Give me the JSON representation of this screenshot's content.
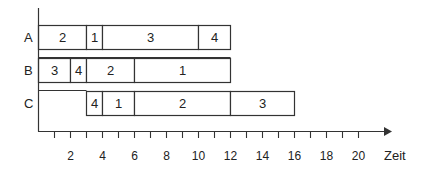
{
  "diagram": {
    "type": "gantt",
    "axis_label": "Zeit",
    "rows": [
      {
        "label": "A",
        "tasks": [
          {
            "label": "2",
            "start": 0,
            "end": 3
          },
          {
            "label": "1",
            "start": 3,
            "end": 4
          },
          {
            "label": "3",
            "start": 4,
            "end": 10
          },
          {
            "label": "4",
            "start": 10,
            "end": 12
          }
        ]
      },
      {
        "label": "B",
        "tasks": [
          {
            "label": "3",
            "start": 0,
            "end": 2
          },
          {
            "label": "4",
            "start": 2,
            "end": 3
          },
          {
            "label": "2",
            "start": 3,
            "end": 6
          },
          {
            "label": "1",
            "start": 6,
            "end": 12
          }
        ]
      },
      {
        "label": "C",
        "tasks": [
          {
            "label": "4",
            "start": 3,
            "end": 4
          },
          {
            "label": "1",
            "start": 4,
            "end": 6
          },
          {
            "label": "2",
            "start": 6,
            "end": 12
          },
          {
            "label": "3",
            "start": 12,
            "end": 16
          }
        ]
      }
    ],
    "ticks": [
      1,
      2,
      3,
      4,
      5,
      6,
      7,
      8,
      9,
      10,
      11,
      12,
      13,
      14,
      15,
      16,
      17,
      18,
      19,
      20
    ],
    "tick_labels": [
      "2",
      "4",
      "6",
      "8",
      "10",
      "12",
      "14",
      "16",
      "18",
      "20"
    ],
    "colors": {
      "line": "#333333",
      "fill": "#ffffff",
      "text": "#222222"
    }
  }
}
